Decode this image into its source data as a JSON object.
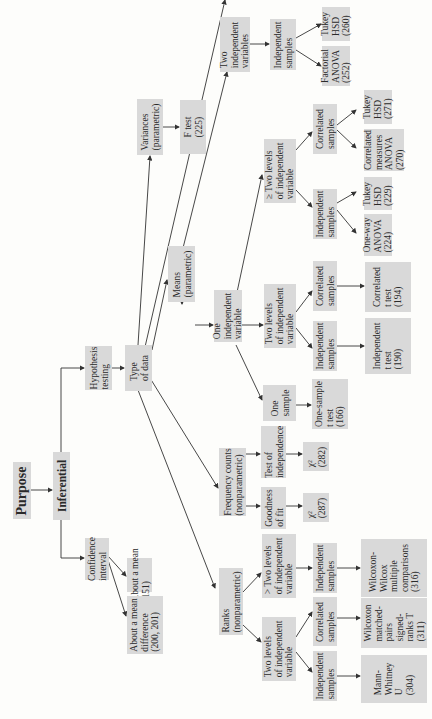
{
  "diagram": {
    "orientation": "rotated-90-ccw",
    "box_color": "#d9d9d9",
    "line_color": "#333333",
    "nodes": {
      "purpose": "Purpose",
      "inferential": "Inferential",
      "confidence_interval": "Confidence\ninterval",
      "about_mean": "About a mean\n(151)",
      "about_mean_difference": "About a mean\ndifference\n(200, 201)",
      "hypothesis_testing": "Hypothesis\ntesting",
      "type_of_data": "Type\nof data",
      "means": "Means\n(parametric)",
      "variances": "Variances\n(parametric)",
      "f_test": "F test\n(225)",
      "two_independent_variables": "Two\nindependent\nvariables",
      "independent_samples_factorial": "Independent\nsamples",
      "tukey_260": "Tukey\nHSD\n(260)",
      "factorial_anova": "Factorial\nANOVA\n(252)",
      "one_independent_variable": "One\nindependent\nvariable",
      "ge_two_levels": "≥ Two levels\nof independent\nvariable",
      "correlated_samples_ge2": "Correlated\nsamples",
      "tukey_271": "Tukey\nHSD\n(271)",
      "correlated_measures_anova": "Correlated\nmeasures\nANOVA\n(270)",
      "independent_samples_ge2": "Independent\nsamples",
      "tukey_229": "Tukey\nHSD\n(229)",
      "one_way_anova": "One-way\nANOVA\n(224)",
      "two_levels": "Two levels\nof independent\nvariable",
      "correlated_samples_2": "Correlated\nsamples",
      "correlated_t": "Correlated\nt test\n(194)",
      "independent_samples_2": "Independent\nsamples",
      "independent_t": "Independent\nt test\n(190)",
      "one_sample": "One\nsample",
      "one_sample_t": "One-sample\nt test\n(166)",
      "frequency_counts": "Frequency counts\n(nonparametric)",
      "test_of_independence": "Test of\nindependence",
      "chi_282": "χ²\n(282)",
      "goodness_of_fit": "Goodness\nof fit",
      "chi_287": "χ²\n(287)",
      "ranks": "Ranks\n(nonparametric)",
      "gt_two_levels_ranks": "> Two levels\nof independent\nvariable",
      "independent_samples_ranks_gt2": "Independent\nsamples",
      "wilcoxon_wilcox": "Wilcoxon-\nWilcox\nmultiple\ncomparisons\n(316)",
      "two_levels_ranks": "Two levels\nof independent\nvariable",
      "correlated_samples_ranks": "Correlated\nsamples",
      "wilcoxon_signed": "Wilcoxon\nmatched-\npairs\nsigned-\nranks T\n(311)",
      "independent_samples_ranks": "Independent\nsamples",
      "mann_whitney": "Mann-\nWhitney\nU\n(304)"
    }
  }
}
